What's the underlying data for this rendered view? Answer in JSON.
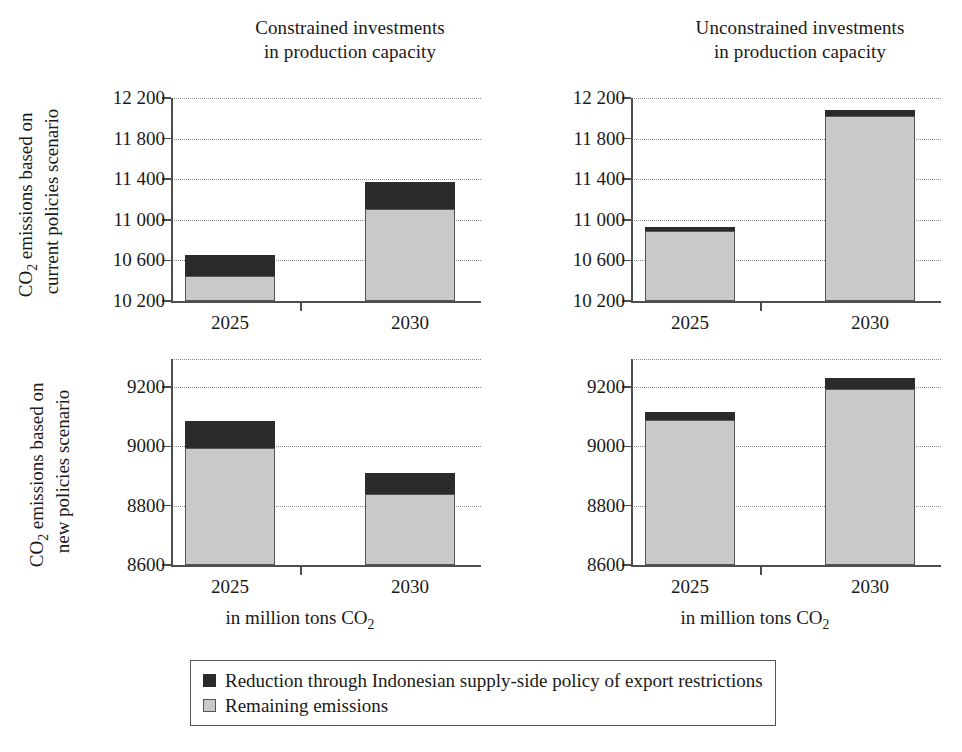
{
  "figure": {
    "axis_caption": "in million tons CO₂",
    "colors": {
      "reduction": "#2b2b2b",
      "remaining": "#c9c9c9",
      "axis": "#4d4d4d",
      "grid": "#8c8c8c"
    }
  },
  "column_titles": [
    "Constrained investments\nin production capacity",
    "Unconstrained investments\nin production capacity"
  ],
  "column_titles_lines": {
    "left_line1": "Constrained investments",
    "left_line2": "in production capacity",
    "right_line1": "Unconstrained investments",
    "right_line2": "in production capacity"
  },
  "row_labels": {
    "top_line1": "CO₂ emissions based on",
    "top_line2": "current policies scenario",
    "bottom_line1": "CO₂ emissions based on",
    "bottom_line2": "new policies scenario"
  },
  "legend": {
    "items": [
      {
        "label": "Reduction through Indonesian supply-side policy of export restrictions",
        "swatch": "dark"
      },
      {
        "label": "Remaining emissions",
        "swatch": "light"
      }
    ]
  },
  "captions": {
    "bottom_left": "in million tons CO₂",
    "bottom_right": "in million tons CO₂"
  },
  "chart_data": [
    {
      "id": "top-left",
      "type": "bar",
      "stacked": true,
      "title": "Constrained investments in production capacity",
      "row_label": "CO₂ emissions based on current policies scenario",
      "xlabel": "",
      "ylabel": "CO₂ emissions based on current policies scenario",
      "categories": [
        "2025",
        "2030"
      ],
      "ylim": [
        10200,
        12200
      ],
      "yticks": [
        10200,
        10600,
        11000,
        11400,
        11800,
        12200
      ],
      "ytick_labels": [
        "10 200",
        "10 600",
        "11 000",
        "11 400",
        "11 800",
        "12 200"
      ],
      "grid": true,
      "series": [
        {
          "name": "Remaining emissions",
          "values": [
            10450,
            11110
          ],
          "color": "#c9c9c9"
        },
        {
          "name": "Reduction through Indonesian supply-side policy of export restrictions",
          "values": [
            200,
            260
          ],
          "color": "#2b2b2b"
        }
      ],
      "totals": [
        10650,
        11370
      ]
    },
    {
      "id": "top-right",
      "type": "bar",
      "stacked": true,
      "title": "Unconstrained investments in production capacity",
      "row_label": "CO₂ emissions based on current policies scenario",
      "xlabel": "",
      "ylabel": "CO₂ emissions based on current policies scenario",
      "categories": [
        "2025",
        "2030"
      ],
      "ylim": [
        10200,
        12200
      ],
      "yticks": [
        10200,
        10600,
        11000,
        11400,
        11800,
        12200
      ],
      "ytick_labels": [
        "10 200",
        "10 600",
        "11 000",
        "11 400",
        "11 800",
        "12 200"
      ],
      "grid": true,
      "series": [
        {
          "name": "Remaining emissions",
          "values": [
            10890,
            12020
          ],
          "color": "#c9c9c9"
        },
        {
          "name": "Reduction through Indonesian supply-side policy of export restrictions",
          "values": [
            40,
            60
          ],
          "color": "#2b2b2b"
        }
      ],
      "totals": [
        10930,
        12080
      ]
    },
    {
      "id": "bottom-left",
      "type": "bar",
      "stacked": true,
      "title": "Constrained investments in production capacity",
      "row_label": "CO₂ emissions based on new policies scenario",
      "xlabel": "in million tons CO₂",
      "ylabel": "CO₂ emissions based on new policies scenario",
      "categories": [
        "2025",
        "2030"
      ],
      "ylim": [
        8600,
        9295
      ],
      "yticks": [
        8600,
        8800,
        9000,
        9200
      ],
      "ytick_labels": [
        "8600",
        "8800",
        "9000",
        "9200"
      ],
      "grid": true,
      "series": [
        {
          "name": "Remaining emissions",
          "values": [
            8995,
            8840
          ],
          "color": "#c9c9c9"
        },
        {
          "name": "Reduction through Indonesian supply-side policy of export restrictions",
          "values": [
            90,
            70
          ],
          "color": "#2b2b2b"
        }
      ],
      "totals": [
        9085,
        8910
      ]
    },
    {
      "id": "bottom-right",
      "type": "bar",
      "stacked": true,
      "title": "Unconstrained investments in production capacity",
      "row_label": "CO₂ emissions based on new policies scenario",
      "xlabel": "in million tons CO₂",
      "ylabel": "CO₂ emissions based on new policies scenario",
      "categories": [
        "2025",
        "2030"
      ],
      "ylim": [
        8600,
        9295
      ],
      "yticks": [
        8600,
        8800,
        9000,
        9200
      ],
      "ytick_labels": [
        "8600",
        "8800",
        "9000",
        "9200"
      ],
      "grid": true,
      "series": [
        {
          "name": "Remaining emissions",
          "values": [
            9090,
            9195
          ],
          "color": "#c9c9c9"
        },
        {
          "name": "Reduction through Indonesian supply-side policy of export restrictions",
          "values": [
            25,
            35
          ],
          "color": "#2b2b2b"
        }
      ],
      "totals": [
        9115,
        9230
      ]
    }
  ]
}
